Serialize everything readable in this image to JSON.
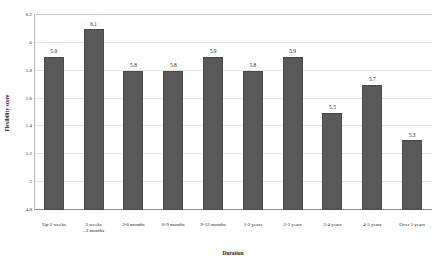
{
  "chart_data": {
    "type": "bar",
    "title": "",
    "xlabel": "Duration",
    "ylabel": "Flexibility score",
    "categories": [
      "Up-2 weeks",
      "2 weeks\n–3 months",
      "3-6 months",
      "6-9 months",
      "9-12 months",
      "1-2 years",
      "2-3 years",
      "3-4 years",
      "4-5 years",
      "Over 5 years"
    ],
    "values": [
      5.9,
      6.1,
      5.8,
      5.8,
      5.9,
      5.8,
      5.9,
      5.5,
      5.7,
      5.3
    ],
    "value_labels": [
      "5.9",
      "6.1",
      "5.8",
      "5.8",
      "5.9",
      "5.8",
      "5.9",
      "5.5",
      "5.7",
      "5.3"
    ],
    "ylim": [
      4.8,
      6.2
    ],
    "ytick_values": [
      6.2,
      6.0,
      5.8,
      5.6,
      5.4,
      5.2,
      5.0,
      4.8
    ],
    "ytick_labels": [
      "6.2",
      "6",
      "5.8",
      "5.6",
      "5.4",
      "5.2",
      "5",
      "4.8"
    ],
    "grid": true,
    "legend": "none",
    "bar_color": "#595959",
    "grid_color": "#e4e4e4",
    "axis_color": "#8c8c8c",
    "background": "#ffffff"
  }
}
